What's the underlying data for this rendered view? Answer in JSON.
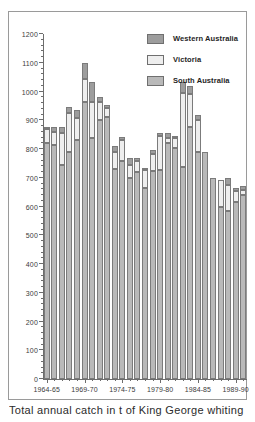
{
  "caption": "Total annual catch in t of King George whiting",
  "legend": {
    "position": "top-right",
    "items": [
      {
        "label": "Western Australia",
        "color": "#9d9d9d",
        "key": "western_australia"
      },
      {
        "label": "Victoria",
        "color": "#eeeeee",
        "key": "victoria"
      },
      {
        "label": "South Australia",
        "color": "#b9b9b9",
        "key": "south_australia"
      }
    ]
  },
  "chart_data": {
    "type": "bar",
    "stacked": true,
    "title": "",
    "subtitle": "",
    "xlabel": "",
    "ylabel": "",
    "ylim": [
      0,
      1200
    ],
    "ytick_step": 100,
    "yminor_step": 20,
    "grid": false,
    "ytick_labels": [
      "0",
      "100",
      "200",
      "300",
      "400",
      "500",
      "600",
      "700",
      "800",
      "900",
      "1000",
      "1100",
      "1200"
    ],
    "xtick_labels": [
      "1964-65",
      "1969-70",
      "1974-75",
      "1979-80",
      "1984-85",
      "1989-90"
    ],
    "xtick_indices": [
      0,
      5,
      10,
      15,
      20,
      25
    ],
    "categories": [
      "1964-65",
      "1965-66",
      "1966-67",
      "1967-68",
      "1968-69",
      "1969-70",
      "1970-71",
      "1971-72",
      "1972-73",
      "1973-74",
      "1974-75",
      "1975-76",
      "1976-77",
      "1977-78",
      "1978-79",
      "1979-80",
      "1980-81",
      "1981-82",
      "1982-83",
      "1983-84",
      "1984-85",
      "1985-86",
      "1986-87",
      "1987-88",
      "1988-89",
      "1989-90",
      "1990-91"
    ],
    "series": [
      {
        "name": "South Australia",
        "color": "#b9b9b9",
        "values": [
          820,
          815,
          745,
          790,
          830,
          965,
          838,
          900,
          912,
          730,
          760,
          700,
          720,
          665,
          725,
          728,
          820,
          805,
          738,
          875,
          790,
          788,
          700,
          600,
          585,
          615,
          640
        ]
      },
      {
        "name": "Victoria",
        "color": "#eeeeee",
        "values": [
          48,
          45,
          110,
          135,
          78,
          80,
          125,
          62,
          30,
          60,
          70,
          46,
          40,
          62,
          58,
          118,
          20,
          32,
          258,
          115,
          110,
          0,
          0,
          92,
          90,
          40,
          18
        ]
      },
      {
        "name": "Western Australia",
        "color": "#9d9d9d",
        "values": [
          2,
          15,
          23,
          20,
          28,
          55,
          70,
          18,
          10,
          20,
          12,
          22,
          10,
          5,
          12,
          10,
          16,
          10,
          38,
          28,
          20,
          0,
          0,
          0,
          25,
          10,
          12
        ]
      }
    ],
    "totals": [
      870,
      875,
      878,
      945,
      936,
      1100,
      1033,
      980,
      952,
      810,
      842,
      768,
      770,
      732,
      795,
      856,
      856,
      847,
      1034,
      1018,
      920,
      788,
      700,
      692,
      700,
      665,
      670
    ]
  }
}
